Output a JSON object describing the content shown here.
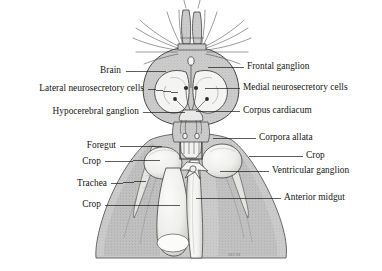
{
  "figure": {
    "kind": "anatomical-diagram",
    "background_color": "#ffffff",
    "ink_color": "#141414",
    "tissue_gray": "#c9c9c9",
    "tissue_gray_dark": "#ababab",
    "organ_white": "#f7f7f5",
    "signature": "MCM"
  },
  "labels_left": [
    {
      "id": "brain",
      "text": "Brain",
      "text_x": 121,
      "text_y": 74,
      "leader": {
        "x1": 126,
        "y1": 71,
        "x2": 166,
        "y2": 71
      }
    },
    {
      "id": "lateral-neurosecretory-cells",
      "text": "Lateral neurosecretory cells",
      "text_x": 144,
      "text_y": 92,
      "leader": {
        "x1": 148,
        "y1": 89,
        "x2": 178,
        "y2": 93
      }
    },
    {
      "id": "hypocerebral-ganglion",
      "text": "Hypocerebral ganglion",
      "text_x": 139,
      "text_y": 115,
      "leader": {
        "x1": 143,
        "y1": 112,
        "x2": 185,
        "y2": 112
      }
    },
    {
      "id": "foregut",
      "text": "Foregut",
      "text_x": 116,
      "text_y": 149,
      "leader": {
        "x1": 120,
        "y1": 146,
        "x2": 162,
        "y2": 146
      }
    },
    {
      "id": "crop-upper-left",
      "text": "Crop",
      "text_x": 101,
      "text_y": 165,
      "leader": {
        "x1": 105,
        "y1": 162,
        "x2": 160,
        "y2": 160
      }
    },
    {
      "id": "trachea",
      "text": "Trachea",
      "text_x": 107,
      "text_y": 187,
      "leader": {
        "x1": 111,
        "y1": 184,
        "x2": 146,
        "y2": 181
      }
    },
    {
      "id": "crop-lower-left",
      "text": "Crop",
      "text_x": 101,
      "text_y": 208,
      "leader": {
        "x1": 105,
        "y1": 205,
        "x2": 180,
        "y2": 205
      }
    }
  ],
  "labels_right": [
    {
      "id": "frontal-ganglion",
      "text": "Frontal ganglion",
      "text_x": 247,
      "text_y": 70,
      "leader": {
        "x1": 208,
        "y1": 67,
        "x2": 244,
        "y2": 67
      }
    },
    {
      "id": "medial-neurosecretory-cells",
      "text": "Medial neurosecretory cells",
      "text_x": 243,
      "text_y": 91,
      "leader": {
        "x1": 205,
        "y1": 88,
        "x2": 240,
        "y2": 88
      }
    },
    {
      "id": "corpus-cardiacum",
      "text": "Corpus cardiacum",
      "text_x": 243,
      "text_y": 114,
      "leader": {
        "x1": 196,
        "y1": 111,
        "x2": 240,
        "y2": 111
      }
    },
    {
      "id": "corpora-allata",
      "text": "Corpora allata",
      "text_x": 259,
      "text_y": 141,
      "leader": {
        "x1": 213,
        "y1": 138,
        "x2": 256,
        "y2": 138
      }
    },
    {
      "id": "crop-right",
      "text": "Crop",
      "text_x": 306,
      "text_y": 159,
      "leader": {
        "x1": 249,
        "y1": 156,
        "x2": 303,
        "y2": 156
      }
    },
    {
      "id": "ventricular-ganglion",
      "text": "Ventricular ganglion",
      "text_x": 272,
      "text_y": 174,
      "leader": {
        "x1": 220,
        "y1": 171,
        "x2": 269,
        "y2": 171
      }
    },
    {
      "id": "anterior-midgut",
      "text": "Anterior midgut",
      "text_x": 284,
      "text_y": 201,
      "leader": {
        "x1": 196,
        "y1": 198,
        "x2": 281,
        "y2": 198
      }
    }
  ],
  "signature": {
    "text": "MCM",
    "x": 228,
    "y": 252
  }
}
